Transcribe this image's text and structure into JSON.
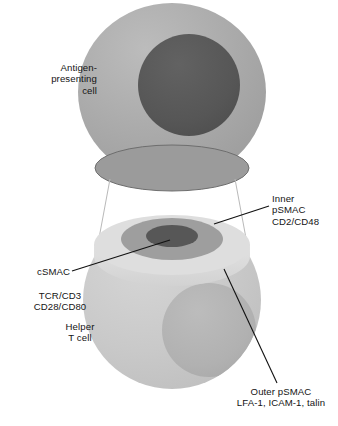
{
  "figure": {
    "type": "biological-diagram",
    "background_color": "#ffffff"
  },
  "labels": {
    "apc": "Antigen-\npresenting\ncell",
    "inner_psmac": "Inner\npSMAC\nCD2/CD48",
    "csmac": "cSMAC",
    "tcr": "TCR/CD3\nCD28/CD80",
    "helper_t_cell": "Helper\nT cell",
    "outer_psmac": "Outer pSMAC\nLFA-1, ICAM-1, talin"
  },
  "colors": {
    "apc_body": "#a9a9a9",
    "apc_nucleus": "#565656",
    "apc_base_face": "#9b9b9b",
    "apc_base_outline": "#6e6e6e",
    "tcell_body": "#c9c9c9",
    "tcell_nucleus": "#b2b2b2",
    "outer_psmac": "#dedede",
    "inner_psmac": "#9e9e9e",
    "csmac": "#575757",
    "leader_line": "#111111",
    "guide_line": "#b9b9b9",
    "text": "#141414"
  },
  "shapes": {
    "apc_sphere": {
      "cx": 172,
      "cy": 92,
      "rx": 94,
      "ry": 89
    },
    "apc_nucleus": {
      "cx": 189,
      "cy": 85,
      "r": 51
    },
    "apc_base_ellipse": {
      "cx": 172,
      "cy": 168,
      "rx": 77,
      "ry": 23
    },
    "tcell_sphere": {
      "cx": 172,
      "cy": 300,
      "rx": 89,
      "ry": 89
    },
    "tcell_nucleus": {
      "cx": 209,
      "cy": 330,
      "r": 47
    },
    "synapse_outer": {
      "cx": 172,
      "cy": 245,
      "rx": 78,
      "ry": 30
    },
    "synapse_inner": {
      "cx": 172,
      "cy": 239,
      "rx": 51,
      "ry": 21
    },
    "synapse_center": {
      "cx": 172,
      "cy": 236,
      "rx": 26,
      "ry": 11
    }
  },
  "leaders": {
    "inner_psmac": {
      "x1": 269,
      "y1": 206,
      "x2": 214,
      "y2": 224
    },
    "csmac": {
      "x1": 72,
      "y1": 271,
      "x2": 170,
      "y2": 240
    },
    "outer_psmac": {
      "x1": 277,
      "y1": 383,
      "x2": 224,
      "y2": 269
    }
  },
  "guides": [
    {
      "x1": 110,
      "y1": 179,
      "x2": 98,
      "y2": 247
    },
    {
      "x1": 235,
      "y1": 179,
      "x2": 247,
      "y2": 247
    }
  ]
}
